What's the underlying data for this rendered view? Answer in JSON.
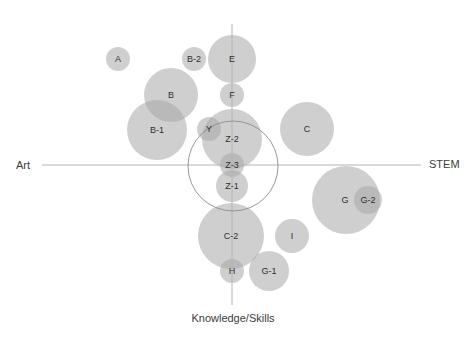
{
  "axes": {
    "left_label": "Art",
    "right_label": "STEM",
    "bottom_label": "Knowledge/Skills",
    "horizontal": {
      "x1": 42,
      "x2": 421,
      "y": 165
    },
    "vertical": {
      "x": 232,
      "y1": 24,
      "y2": 305
    },
    "color": "#b4b4b4"
  },
  "highlight_ring": {
    "cx": 233,
    "cy": 166,
    "r": 45,
    "color": "#8c8c8c"
  },
  "bubble_style": {
    "fill": "#a8a8a8",
    "opacity": 0.55,
    "label_color": "#2e2e2e"
  },
  "bubbles": [
    {
      "id": "A",
      "label": "A",
      "cx": 118,
      "cy": 59,
      "r": 12
    },
    {
      "id": "B-2",
      "label": "B-2",
      "cx": 194,
      "cy": 59,
      "r": 12
    },
    {
      "id": "E",
      "label": "E",
      "cx": 232,
      "cy": 59,
      "r": 24
    },
    {
      "id": "F",
      "label": "F",
      "cx": 232,
      "cy": 95,
      "r": 12
    },
    {
      "id": "B",
      "label": "B",
      "cx": 171,
      "cy": 95,
      "r": 27
    },
    {
      "id": "B-1",
      "label": "B-1",
      "cx": 157,
      "cy": 130,
      "r": 30
    },
    {
      "id": "Z-2",
      "label": "Z-2",
      "cx": 232,
      "cy": 139,
      "r": 30
    },
    {
      "id": "Y",
      "label": "Y",
      "cx": 209,
      "cy": 129,
      "r": 12
    },
    {
      "id": "Z-3",
      "label": "Z-3",
      "cx": 232,
      "cy": 165,
      "r": 12
    },
    {
      "id": "Z-1",
      "label": "Z-1",
      "cx": 232,
      "cy": 186,
      "r": 16
    },
    {
      "id": "C",
      "label": "C",
      "cx": 307,
      "cy": 129,
      "r": 27
    },
    {
      "id": "G",
      "label": "G",
      "cx": 346,
      "cy": 200,
      "r": 34,
      "label_dx": -1
    },
    {
      "id": "G-2",
      "label": "G-2",
      "cx": 368,
      "cy": 200,
      "r": 14
    },
    {
      "id": "C-2",
      "label": "C-2",
      "cx": 231,
      "cy": 236,
      "r": 33
    },
    {
      "id": "I",
      "label": "I",
      "cx": 292,
      "cy": 236,
      "r": 17
    },
    {
      "id": "H",
      "label": "H",
      "cx": 232,
      "cy": 271,
      "r": 12
    },
    {
      "id": "G-1",
      "label": "G-1",
      "cx": 269,
      "cy": 271,
      "r": 20
    }
  ]
}
